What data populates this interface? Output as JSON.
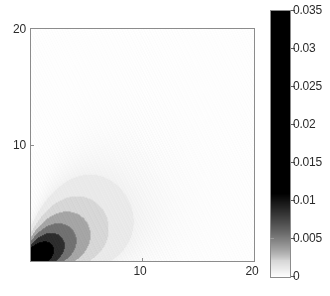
{
  "figure": {
    "width": 330,
    "height": 296,
    "background": "#ffffff"
  },
  "chart_data": {
    "type": "heatmap",
    "title": "",
    "subtitle": "",
    "xlabel": "",
    "ylabel": "",
    "xlim": [
      0,
      20
    ],
    "ylim": [
      0,
      20
    ],
    "zlim": [
      0,
      0.035
    ],
    "grid": false,
    "colormap": "grayscale-inverted",
    "colormap_description": "white at low values, black at high values",
    "xtick_labels": [
      "10",
      "20"
    ],
    "xtick_values": [
      10,
      20
    ],
    "ytick_labels": [
      "10",
      "20"
    ],
    "ytick_values": [
      10,
      20
    ],
    "annotations": [],
    "legend_position": "none",
    "colorbar": {
      "position": "right",
      "orientation": "vertical",
      "min": 0,
      "max": 0.035,
      "tick_labels": [
        "0.035",
        "0.03",
        "0.025",
        "0.02",
        "0.015",
        "0.01",
        "0.005",
        "0"
      ],
      "tick_values": [
        0.035,
        0.03,
        0.025,
        0.02,
        0.015,
        0.01,
        0.005,
        0
      ],
      "saturation_value": 0.011,
      "saturation_note": "gradient ramps white-to-black between 0.002 and 0.011; solid black above"
    },
    "field_description": "Scalar concentration plume originating at the lower-left corner (0,0) and diffusing diagonally toward upper right, peak value at source, decaying to zero in the far field.",
    "plume": {
      "source_x": 0.2,
      "source_y": 0.2,
      "peak_value": 0.035,
      "axis_angle_deg": 33,
      "axial_decay_length": 5.2,
      "lateral_spread_base": 0.55,
      "lateral_spread_growth": 0.34,
      "tip_x": 11.5,
      "tip_y": 7.2,
      "contour_levels": [
        0.0008,
        0.0016,
        0.0028,
        0.0045,
        0.007,
        0.011,
        0.018,
        0.026,
        0.035
      ]
    },
    "samples_along_axis": {
      "distance": [
        0,
        1,
        2,
        3,
        4,
        5,
        6,
        7,
        8,
        9,
        10,
        11,
        12,
        13,
        14
      ],
      "value": [
        0.035,
        0.0205,
        0.0118,
        0.0072,
        0.0046,
        0.0031,
        0.0022,
        0.0016,
        0.00118,
        0.0009,
        0.0007,
        0.00052,
        0.00038,
        0.00026,
        0.00016
      ]
    }
  },
  "colorbar_labels": {
    "l0": "0.035",
    "l1": "0.03",
    "l2": "0.025",
    "l3": "0.02",
    "l4": "0.015",
    "l5": "0.01",
    "l6": "0.005",
    "l7": "0"
  },
  "axis_labels": {
    "y_top": "20",
    "y_mid": "10",
    "x_mid": "10",
    "x_right": "20"
  }
}
